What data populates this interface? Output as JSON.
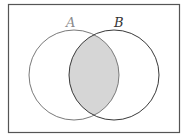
{
  "diagram": {
    "type": "venn",
    "sets": [
      {
        "label": "A",
        "color": "#8a8a8a"
      },
      {
        "label": "B",
        "color": "#333333"
      }
    ],
    "shaded_region": "A ∩ B",
    "shade_color": "#d6d6d6",
    "frame_color": "#555555"
  }
}
